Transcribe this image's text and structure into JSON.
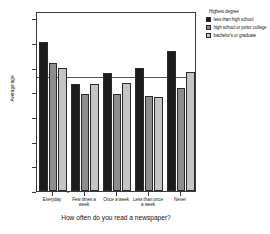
{
  "chart_data": {
    "type": "bar",
    "title": "",
    "xlabel": "How often do you read a newspaper?",
    "ylabel": "Average age",
    "ylim": [
      0,
      73
    ],
    "yticks": [
      0,
      10,
      20,
      30,
      40,
      50,
      60,
      70
    ],
    "ytick_labels": [
      "0",
      "10",
      "20",
      "30",
      "40",
      "50",
      "60",
      "70"
    ],
    "grid": false,
    "legend_position": "right",
    "reference_line": {
      "value": 46,
      "label": ""
    },
    "categories": [
      "Everyday",
      "Few times a\nweek",
      "Once a week",
      "Less than once\na week",
      "Never"
    ],
    "series": [
      {
        "name": "less than high school",
        "color": "#1c1c1c",
        "values": [
          60.5,
          43.3,
          47.7,
          49.8,
          56.7
        ]
      },
      {
        "name": "high school or junior college",
        "color": "#8d8d8d",
        "values": [
          51.8,
          39.5,
          39.5,
          38.4,
          41.8
        ]
      },
      {
        "name": "bachelor's or graduate",
        "color": "#c4c4c4",
        "values": [
          49.8,
          43.3,
          44.0,
          38.0,
          48.3
        ]
      }
    ]
  },
  "legend": {
    "title": "Highest degree",
    "items": [
      {
        "label": "less than high school",
        "color": "#1c1c1c"
      },
      {
        "label": "high school or junior college",
        "color": "#8d8d8d"
      },
      {
        "label": "bachelor's or graduate",
        "color": "#c4c4c4"
      }
    ]
  },
  "axes": {
    "y_title": "Average age",
    "x_title": "How often do you read a newspaper?"
  }
}
